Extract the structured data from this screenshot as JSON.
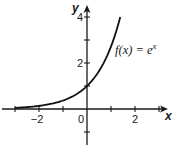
{
  "chart_data": {
    "type": "line",
    "title": "",
    "xlabel": "x",
    "ylabel": "y",
    "xlim": [
      -3.6,
      3.6
    ],
    "ylim": [
      -1.4,
      4.4
    ],
    "x_ticks": [
      -3,
      -2,
      -1,
      0,
      1,
      2,
      3
    ],
    "x_tick_labels": [
      {
        "value": -2,
        "label": "−2"
      },
      {
        "value": 0,
        "label": "0"
      },
      {
        "value": 2,
        "label": "2"
      }
    ],
    "y_ticks": [
      -1,
      1,
      2,
      3,
      4
    ],
    "y_tick_labels": [
      {
        "value": 2,
        "label": "2"
      },
      {
        "value": 4,
        "label": "4"
      }
    ],
    "grid": false,
    "legend": "none",
    "series": [
      {
        "name": "f(x) = e^x",
        "function": "exp(x)",
        "x": [
          -3,
          -2.5,
          -2,
          -1.5,
          -1,
          -0.5,
          0,
          0.5,
          1,
          1.2,
          1.386
        ],
        "values": [
          0.05,
          0.082,
          0.135,
          0.223,
          0.368,
          0.607,
          1.0,
          1.649,
          2.718,
          3.32,
          4.0
        ]
      }
    ],
    "annotations": [
      {
        "text_main": "f(x) = e",
        "text_sup": "x",
        "x": 0.95,
        "y": 2.7
      }
    ]
  },
  "labels": {
    "x_axis": "x",
    "y_axis": "y",
    "function_main": "f(x) = e",
    "function_sup": "x"
  }
}
